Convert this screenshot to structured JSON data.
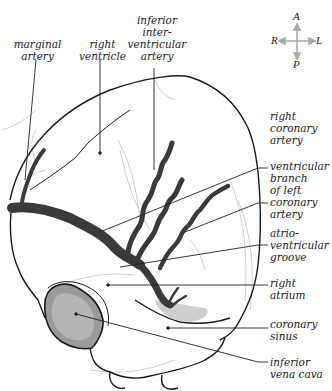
{
  "figure": {
    "compass": {
      "top": "A",
      "bottom": "P",
      "left": "R",
      "right": "L",
      "arrow_color": "#a8a8a8"
    },
    "labels": {
      "marginal_artery": "marginal\nartery",
      "right_ventricle": "right\nventricle",
      "inferior_interventricular_artery": "inferior\ninter-\nventricular\nartery",
      "right_coronary_artery": "right\ncoronary\nartery",
      "ventricular_branch_left_coronary": "ventricular\nbranch\nof left\ncoronary\nartery",
      "atrioventricular_groove": "atrio-\nventricular\ngroove",
      "right_atrium": "right\natrium",
      "coronary_sinus": "coronary\nsinus",
      "inferior_vena_cava": "inferior\nvena cava"
    },
    "colors": {
      "outline": "#1a1a1a",
      "artery_fill": "#3a3a3a",
      "leader_line": "#222222",
      "faint_line": "#c8c8c8",
      "stipple": "#8a8a8a"
    }
  }
}
